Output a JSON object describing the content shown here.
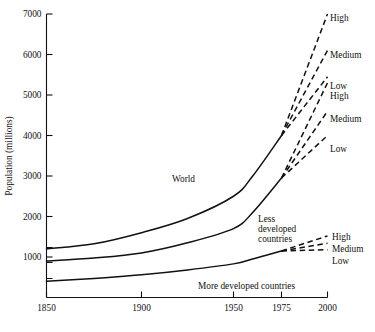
{
  "chart_data": {
    "type": "line",
    "title": "",
    "xlabel": "",
    "ylabel": "Population (millions)",
    "xlim": [
      1850,
      2000
    ],
    "ylim": [
      0,
      7000
    ],
    "grid": false,
    "legend": "inline-annotations",
    "x_ticks": [
      "1850",
      "1900",
      "1950",
      "1975",
      "2000"
    ],
    "x_tick_values": [
      1850,
      1900,
      1950,
      1975,
      2000
    ],
    "y_ticks": [
      "1000",
      "2000",
      "3000",
      "4000",
      "5000",
      "6000",
      "7000"
    ],
    "y_tick_values": [
      1000,
      2000,
      3000,
      4000,
      5000,
      6000,
      7000
    ],
    "note": "Solid lines are historical estimates 1850-1975; dashed lines are High/Medium/Low projections 1975-2000.",
    "series": [
      {
        "name": "World",
        "style": "solid",
        "x": [
          1850,
          1875,
          1900,
          1925,
          1950,
          1960,
          1975
        ],
        "values": [
          1200,
          1325,
          1600,
          1950,
          2500,
          3000,
          4000
        ],
        "projections": [
          {
            "name": "High",
            "x": [
              1975,
              2000
            ],
            "values": [
              4000,
              7000
            ]
          },
          {
            "name": "Medium",
            "x": [
              1975,
              2000
            ],
            "values": [
              4000,
              6100
            ]
          },
          {
            "name": "Low",
            "x": [
              1975,
              2000
            ],
            "values": [
              4000,
              5450
            ]
          }
        ]
      },
      {
        "name": "Less developed countries",
        "style": "solid",
        "x": [
          1850,
          1875,
          1900,
          1925,
          1950,
          1960,
          1975
        ],
        "values": [
          900,
          975,
          1100,
          1350,
          1700,
          2100,
          2950
        ],
        "projections": [
          {
            "name": "High",
            "x": [
              1975,
              2000
            ],
            "values": [
              2950,
              5300
            ]
          },
          {
            "name": "Medium",
            "x": [
              1975,
              2000
            ],
            "values": [
              2950,
              4600
            ]
          },
          {
            "name": "Low",
            "x": [
              1975,
              2000
            ],
            "values": [
              2950,
              4000
            ]
          }
        ]
      },
      {
        "name": "More developed countries",
        "style": "solid",
        "x": [
          1850,
          1875,
          1900,
          1925,
          1950,
          1960,
          1975
        ],
        "values": [
          400,
          470,
          560,
          680,
          830,
          950,
          1150
        ],
        "projections": [
          {
            "name": "High",
            "x": [
              1975,
              2000
            ],
            "values": [
              1150,
              1520
            ]
          },
          {
            "name": "Medium",
            "x": [
              1975,
              2000
            ],
            "values": [
              1150,
              1340
            ]
          },
          {
            "name": "Low",
            "x": [
              1975,
              2000
            ],
            "values": [
              1150,
              1180
            ]
          }
        ]
      }
    ],
    "annotations": {
      "world_label": "World",
      "less_developed_label_lines": [
        "Less",
        "developed",
        "countries"
      ],
      "more_developed_label": "More developed countries",
      "world_high": "High",
      "world_medium": "Medium",
      "world_low": "Low",
      "less_high": "High",
      "less_medium": "Medium",
      "less_low": "Low",
      "more_high": "High",
      "more_medium": "Medium",
      "more_low": "Low"
    },
    "colors": {
      "line": "#111111",
      "background": "#ffffff",
      "text": "#111111"
    }
  }
}
